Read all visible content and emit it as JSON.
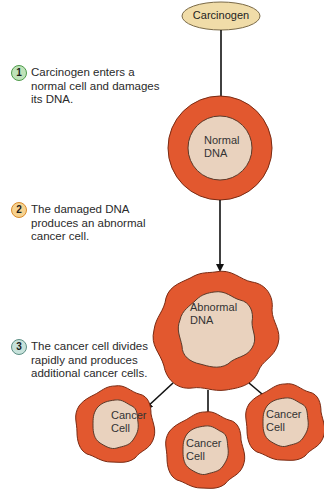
{
  "diagram": {
    "colors": {
      "cell_outer": "#e2582f",
      "cell_inner": "#e9d2be",
      "carcinogen_fill": "#f0dca8",
      "arrow": "#111111",
      "badge1": "#8fc98a",
      "badge2": "#e8a24a",
      "badge3": "#8fb5ac"
    },
    "carcinogen": {
      "label": "Carcinogen"
    },
    "normal_cell": {
      "label_line1": "Normal",
      "label_line2": "DNA"
    },
    "abnormal_cell": {
      "label_line1": "Abnormal",
      "label_line2": "DNA"
    },
    "daughter_cells": [
      {
        "label_line1": "Cancer",
        "label_line2": "Cell"
      },
      {
        "label_line1": "Cancer",
        "label_line2": "Cell"
      },
      {
        "label_line1": "Cancer",
        "label_line2": "Cell"
      }
    ],
    "steps": [
      {
        "number": "1",
        "text": "Carcinogen enters a normal cell and damages its DNA."
      },
      {
        "number": "2",
        "text": "The damaged DNA produces an abnormal cancer cell."
      },
      {
        "number": "3",
        "text": "The cancer cell divides rapidly and produces additional cancer cells."
      }
    ]
  }
}
